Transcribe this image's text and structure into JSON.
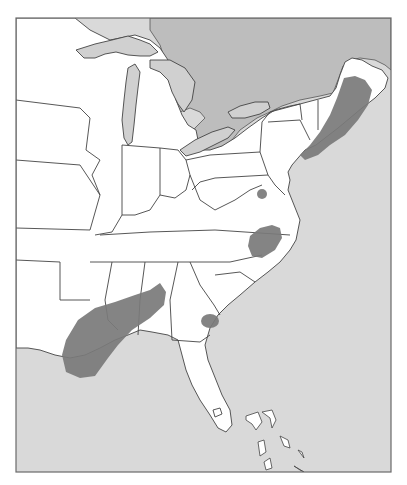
{
  "map": {
    "title": "",
    "extent": "Eastern United States",
    "colors": {
      "ocean": "#d9d9d9",
      "canada": "#bdbdbd",
      "land": "#ffffff",
      "lakes": "#d0d0d0",
      "highlight_region": "#7a7a7a",
      "border": "#444444"
    },
    "highlighted_regions": [
      {
        "name": "New England coast",
        "description": "Coastal band from Maine to New Jersey"
      },
      {
        "name": "Northern Virginia",
        "description": "Small patch near Washington DC"
      },
      {
        "name": "Southeastern Virginia / NE North Carolina",
        "description": "Patch around Norfolk area"
      },
      {
        "name": "Gulf Coast",
        "description": "Band from Louisiana coast NE through Mississippi/Alabama"
      },
      {
        "name": "Georgia/South Carolina coast",
        "description": "Small patch near Savannah"
      }
    ]
  }
}
